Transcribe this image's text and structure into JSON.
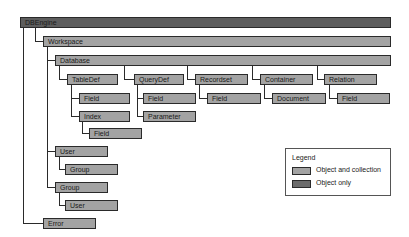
{
  "diagram": {
    "nodes": {
      "dbengine": "DBEngine",
      "workspace": "Workspace",
      "database": "Database",
      "tabledef": "TableDef",
      "tabledef_field": "Field",
      "index": "Index",
      "index_field": "Field",
      "querydef": "QueryDef",
      "querydef_field": "Field",
      "parameter": "Parameter",
      "recordset": "Recordset",
      "recordset_field": "Field",
      "container": "Container",
      "document": "Document",
      "relation": "Relation",
      "relation_field": "Field",
      "user": "User",
      "user_group": "Group",
      "group": "Group",
      "group_user": "User",
      "error": "Error"
    },
    "legend": {
      "title": "Legend",
      "items": [
        {
          "label": "Object and collection",
          "color": "#a3a3a3"
        },
        {
          "label": "Object only",
          "color": "#6b6b6b"
        }
      ]
    }
  }
}
